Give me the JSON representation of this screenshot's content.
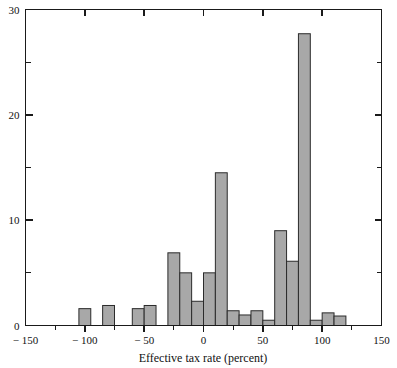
{
  "chart_data": {
    "type": "bar",
    "title": "",
    "subtitle": "",
    "xlabel": "Effective tax rate (percent)",
    "ylabel": "",
    "xlim": [
      -150,
      150
    ],
    "ylim": [
      0,
      30
    ],
    "grid": false,
    "legend": null,
    "bin_width": 10,
    "x_ticks_major": [
      -150,
      -100,
      -50,
      0,
      50,
      100,
      150
    ],
    "x_tick_labels": [
      "− 150",
      "− 100",
      "− 50",
      "0",
      "50",
      "100",
      "150"
    ],
    "x_ticks_minor": [
      -125,
      -75,
      -25,
      25,
      75,
      125
    ],
    "y_ticks_major": [
      0,
      10,
      20,
      30
    ],
    "y_tick_labels": [
      "0",
      "10",
      "20",
      "30"
    ],
    "y_ticks_minor": [
      5,
      15,
      25
    ],
    "bin_starts": [
      -105,
      -85,
      -60,
      -50,
      -30,
      -20,
      -10,
      0,
      10,
      20,
      30,
      40,
      50,
      60,
      70,
      80,
      90,
      100,
      110
    ],
    "values": [
      1.6,
      1.9,
      1.6,
      1.9,
      6.9,
      5.0,
      2.3,
      5.0,
      14.5,
      1.4,
      1.0,
      1.4,
      0.5,
      9.0,
      6.1,
      27.7,
      0.5,
      1.2,
      0.9
    ],
    "bars": [
      {
        "x0": -105,
        "x1": -95,
        "value": 1.6
      },
      {
        "x0": -85,
        "x1": -75,
        "value": 1.9
      },
      {
        "x0": -60,
        "x1": -50,
        "value": 1.6
      },
      {
        "x0": -50,
        "x1": -40,
        "value": 1.9
      },
      {
        "x0": -30,
        "x1": -20,
        "value": 6.9
      },
      {
        "x0": -20,
        "x1": -10,
        "value": 5.0
      },
      {
        "x0": -10,
        "x1": 0,
        "value": 2.3
      },
      {
        "x0": 0,
        "x1": 10,
        "value": 5.0
      },
      {
        "x0": 10,
        "x1": 20,
        "value": 14.5
      },
      {
        "x0": 20,
        "x1": 30,
        "value": 1.4
      },
      {
        "x0": 30,
        "x1": 40,
        "value": 1.0
      },
      {
        "x0": 40,
        "x1": 50,
        "value": 1.4
      },
      {
        "x0": 50,
        "x1": 60,
        "value": 0.5
      },
      {
        "x0": 60,
        "x1": 70,
        "value": 9.0
      },
      {
        "x0": 70,
        "x1": 80,
        "value": 6.1
      },
      {
        "x0": 80,
        "x1": 90,
        "value": 27.7
      },
      {
        "x0": 90,
        "x1": 100,
        "value": 0.5
      },
      {
        "x0": 100,
        "x1": 110,
        "value": 1.2
      },
      {
        "x0": 110,
        "x1": 120,
        "value": 0.9
      }
    ],
    "colors": {
      "bar_fill": "#a8a8a8",
      "bar_stroke": "#2b2b2b",
      "axis": "#1a1a1a",
      "background": "#ffffff",
      "text": "#111111"
    }
  }
}
